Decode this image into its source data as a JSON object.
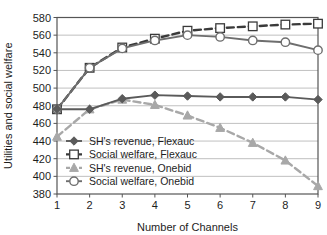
{
  "chart_data": {
    "type": "line",
    "title": "",
    "xlabel": "Number of Channels",
    "ylabel": "Utilities and social welfare",
    "x": [
      1,
      2,
      3,
      4,
      5,
      6,
      7,
      8,
      9
    ],
    "xlim": [
      1,
      9
    ],
    "ylim": [
      380,
      580
    ],
    "xticks": [
      "1",
      "2",
      "3",
      "4",
      "5",
      "6",
      "7",
      "8",
      "9"
    ],
    "yticks": [
      "380",
      "400",
      "420",
      "440",
      "460",
      "480",
      "500",
      "520",
      "540",
      "560",
      "580"
    ],
    "grid": "horizontal",
    "legend_position": "lower-left-inside",
    "series": [
      {
        "name": "SH's revenue, Flexauc",
        "marker": "diamond",
        "linestyle": "solid",
        "color": "#5a5a5a",
        "values": [
          476,
          476,
          488,
          492,
          491,
          490,
          490,
          490,
          487
        ]
      },
      {
        "name": "Social welfare, Flexauc",
        "marker": "square",
        "linestyle": "dashed",
        "color": "#3a3a3a",
        "values": [
          476,
          523,
          546,
          556,
          565,
          568,
          570,
          572,
          573
        ]
      },
      {
        "name": "SH's revenue, Onebid",
        "marker": "triangle",
        "linestyle": "dashed",
        "color": "#a8a8a8",
        "values": [
          445,
          476,
          487,
          481,
          469,
          455,
          438,
          418,
          389
        ]
      },
      {
        "name": "Social welfare, Onebid",
        "marker": "circle",
        "linestyle": "solid",
        "color": "#6e6e6e",
        "values": [
          476,
          523,
          545,
          554,
          560,
          558,
          554,
          552,
          543
        ]
      }
    ]
  },
  "legend": {
    "items": [
      {
        "label": "SH's revenue, Flexauc",
        "marker": "diamond-marker-icon"
      },
      {
        "label": "Social welfare, Flexauc",
        "marker": "square-marker-icon"
      },
      {
        "label": "SH's revenue, Onebid",
        "marker": "triangle-marker-icon"
      },
      {
        "label": "Social welfare, Onebid",
        "marker": "circle-marker-icon"
      }
    ]
  },
  "colors": {
    "axis": "#555555",
    "grid": "#b9b9b9",
    "text": "#1d1d1d",
    "flexauc_revenue": "#5a5a5a",
    "flexauc_welfare": "#3a3a3a",
    "onebid_revenue": "#a8a8a8",
    "onebid_welfare": "#6e6e6e"
  }
}
